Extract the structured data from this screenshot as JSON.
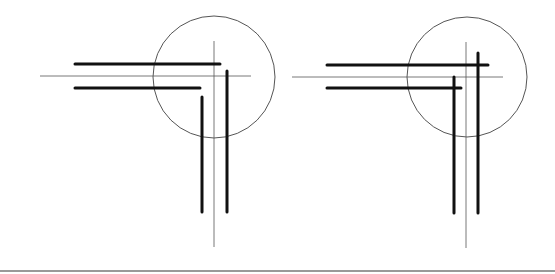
{
  "colors": {
    "background": "#ffffff",
    "thick_line": "#111111",
    "thin_line": "#555555",
    "circle": "#555555",
    "rule": "#777777"
  },
  "diagrams": [
    {
      "id": "left",
      "circle": {
        "cx": 214,
        "cy": 77,
        "r": 61
      },
      "axis_h": {
        "x1": 40,
        "y1": 76,
        "x2": 251,
        "y2": 76
      },
      "axis_v": {
        "x1": 214,
        "y1": 41,
        "x2": 214,
        "y2": 247
      },
      "thick": [
        {
          "x1": 75,
          "y1": 64,
          "x2": 220,
          "y2": 64
        },
        {
          "x1": 75,
          "y1": 88,
          "x2": 200,
          "y2": 88
        },
        {
          "x1": 227,
          "y1": 71,
          "x2": 227,
          "y2": 212
        },
        {
          "x1": 202,
          "y1": 97,
          "x2": 202,
          "y2": 212
        }
      ]
    },
    {
      "id": "right",
      "circle": {
        "cx": 467,
        "cy": 77,
        "r": 60
      },
      "axis_h": {
        "x1": 292,
        "y1": 77,
        "x2": 503,
        "y2": 77
      },
      "axis_v": {
        "x1": 466,
        "y1": 42,
        "x2": 466,
        "y2": 248
      },
      "thick": [
        {
          "x1": 327,
          "y1": 65,
          "x2": 488,
          "y2": 65
        },
        {
          "x1": 327,
          "y1": 88,
          "x2": 461,
          "y2": 88
        },
        {
          "x1": 478,
          "y1": 53,
          "x2": 478,
          "y2": 213
        },
        {
          "x1": 454,
          "y1": 77,
          "x2": 454,
          "y2": 213
        }
      ]
    }
  ],
  "bottom_rule": {
    "x1": 0,
    "y1": 271,
    "x2": 555,
    "y2": 271
  }
}
